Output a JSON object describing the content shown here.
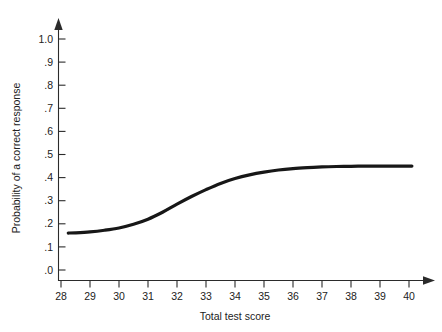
{
  "chart_data": {
    "type": "line",
    "title": "",
    "subtitle": "",
    "xlabel": "Total test score",
    "ylabel": "Probability of a correct response",
    "xlim": [
      28,
      40
    ],
    "ylim": [
      0.0,
      1.0
    ],
    "grid": false,
    "legend": "none",
    "x_ticks": [
      "28",
      "29",
      "30",
      "31",
      "32",
      "33",
      "34",
      "35",
      "36",
      "37",
      "38",
      "39",
      "40"
    ],
    "x_tick_values": [
      28,
      29,
      30,
      31,
      32,
      33,
      34,
      35,
      36,
      37,
      38,
      39,
      40
    ],
    "y_ticks": [
      "1.0",
      ".9",
      ".8",
      ".7",
      ".6",
      ".5",
      ".4",
      ".3",
      ".2",
      ".1",
      ".0"
    ],
    "y_tick_values": [
      1.0,
      0.9,
      0.8,
      0.7,
      0.6,
      0.5,
      0.4,
      0.3,
      0.2,
      0.1,
      0.0
    ],
    "series": [
      {
        "name": "Item characteristic curve",
        "color": "#171717",
        "x": [
          28.25,
          28.5,
          29.0,
          29.5,
          30.0,
          30.5,
          31.0,
          31.5,
          32.0,
          32.5,
          33.0,
          33.5,
          34.0,
          34.5,
          35.0,
          35.5,
          36.0,
          36.5,
          37.0,
          37.5,
          38.0,
          38.5,
          39.0,
          39.5,
          40.1
        ],
        "values": [
          0.16,
          0.161,
          0.165,
          0.172,
          0.182,
          0.198,
          0.22,
          0.25,
          0.285,
          0.318,
          0.348,
          0.375,
          0.396,
          0.412,
          0.424,
          0.433,
          0.439,
          0.443,
          0.446,
          0.448,
          0.449,
          0.45,
          0.45,
          0.45,
          0.45
        ]
      }
    ]
  },
  "axes": {
    "x_arrow": "arrow-right",
    "y_arrow": "arrow-up"
  }
}
